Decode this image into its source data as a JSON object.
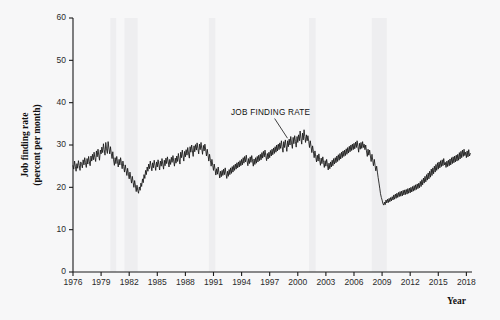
{
  "figure": {
    "background_color": "#f7f7f8",
    "ink_color": "#141414",
    "band_color": "#e9e9ec"
  },
  "chart_data": {
    "type": "line",
    "title": "",
    "xlabel": "Year",
    "ylabel_line1": "Job finding rate",
    "ylabel_line2": "(percent per month)",
    "xlim": [
      1976,
      2018.6
    ],
    "ylim": [
      0,
      60
    ],
    "grid": false,
    "legend": "none",
    "xticks": [
      1976,
      1979,
      1982,
      1985,
      1988,
      1991,
      1994,
      1997,
      2000,
      2003,
      2006,
      2009,
      2012,
      2015,
      2018
    ],
    "xtick_labels": [
      "1976",
      "1979",
      "1982",
      "1985",
      "1988",
      "1991",
      "1994",
      "1997",
      "2000",
      "2003",
      "2006",
      "2009",
      "2012",
      "2015",
      "2018"
    ],
    "yticks": [
      0,
      10,
      20,
      30,
      40,
      50,
      60
    ],
    "ytick_labels": [
      "0",
      "10",
      "20",
      "30",
      "40",
      "50",
      "60"
    ],
    "annotations": [
      {
        "text": "JOB FINDING RATE",
        "x": 1997.1,
        "y": 37.2,
        "leader_to_x": 1998.9,
        "leader_to_y": 31.6
      }
    ],
    "shaded_bands": [
      {
        "name": "recession-1980",
        "x0": 1980.0,
        "x1": 1980.6
      },
      {
        "name": "recession-1981-82",
        "x0": 1981.5,
        "x1": 1982.9
      },
      {
        "name": "recession-1990-91",
        "x0": 1990.5,
        "x1": 1991.2
      },
      {
        "name": "recession-2001",
        "x0": 2001.2,
        "x1": 2001.9
      },
      {
        "name": "recession-2007-09",
        "x0": 2007.9,
        "x1": 2009.5
      }
    ],
    "series": [
      {
        "name": "Job finding rate",
        "units": "percent per month",
        "frequency": "monthly",
        "x": [
          1976.0,
          1976.08,
          1976.17,
          1976.25,
          1976.33,
          1976.42,
          1976.5,
          1976.58,
          1976.67,
          1976.75,
          1976.83,
          1976.92,
          1977.0,
          1977.08,
          1977.17,
          1977.25,
          1977.33,
          1977.42,
          1977.5,
          1977.58,
          1977.67,
          1977.75,
          1977.83,
          1977.92,
          1978.0,
          1978.08,
          1978.17,
          1978.25,
          1978.33,
          1978.42,
          1978.5,
          1978.58,
          1978.67,
          1978.75,
          1978.83,
          1978.92,
          1979.0,
          1979.08,
          1979.17,
          1979.25,
          1979.33,
          1979.42,
          1979.5,
          1979.58,
          1979.67,
          1979.75,
          1979.83,
          1979.92,
          1980.0,
          1980.08,
          1980.17,
          1980.25,
          1980.33,
          1980.42,
          1980.5,
          1980.58,
          1980.67,
          1980.75,
          1980.83,
          1980.92,
          1981.0,
          1981.08,
          1981.17,
          1981.25,
          1981.33,
          1981.42,
          1981.5,
          1981.58,
          1981.67,
          1981.75,
          1981.83,
          1981.92,
          1982.0,
          1982.08,
          1982.17,
          1982.25,
          1982.33,
          1982.42,
          1982.5,
          1982.58,
          1982.67,
          1982.75,
          1982.83,
          1982.92,
          1983.0,
          1983.08,
          1983.17,
          1983.25,
          1983.33,
          1983.42,
          1983.5,
          1983.58,
          1983.67,
          1983.75,
          1983.83,
          1983.92,
          1984.0,
          1984.08,
          1984.17,
          1984.25,
          1984.33,
          1984.42,
          1984.5,
          1984.58,
          1984.67,
          1984.75,
          1984.83,
          1984.92,
          1985.0,
          1985.08,
          1985.17,
          1985.25,
          1985.33,
          1985.42,
          1985.5,
          1985.58,
          1985.67,
          1985.75,
          1985.83,
          1985.92,
          1986.0,
          1986.08,
          1986.17,
          1986.25,
          1986.33,
          1986.42,
          1986.5,
          1986.58,
          1986.67,
          1986.75,
          1986.83,
          1986.92,
          1987.0,
          1987.08,
          1987.17,
          1987.25,
          1987.33,
          1987.42,
          1987.5,
          1987.58,
          1987.67,
          1987.75,
          1987.83,
          1987.92,
          1988.0,
          1988.08,
          1988.17,
          1988.25,
          1988.33,
          1988.42,
          1988.5,
          1988.58,
          1988.67,
          1988.75,
          1988.83,
          1988.92,
          1989.0,
          1989.08,
          1989.17,
          1989.25,
          1989.33,
          1989.42,
          1989.5,
          1989.58,
          1989.67,
          1989.75,
          1989.83,
          1989.92,
          1990.0,
          1990.08,
          1990.17,
          1990.25,
          1990.33,
          1990.42,
          1990.5,
          1990.58,
          1990.67,
          1990.75,
          1990.83,
          1990.92,
          1991.0,
          1991.08,
          1991.17,
          1991.25,
          1991.33,
          1991.42,
          1991.5,
          1991.58,
          1991.67,
          1991.75,
          1991.83,
          1991.92,
          1992.0,
          1992.08,
          1992.17,
          1992.25,
          1992.33,
          1992.42,
          1992.5,
          1992.58,
          1992.67,
          1992.75,
          1992.83,
          1992.92,
          1993.0,
          1993.08,
          1993.17,
          1993.25,
          1993.33,
          1993.42,
          1993.5,
          1993.58,
          1993.67,
          1993.75,
          1993.83,
          1993.92,
          1994.0,
          1994.08,
          1994.17,
          1994.25,
          1994.33,
          1994.42,
          1994.5,
          1994.58,
          1994.67,
          1994.75,
          1994.83,
          1994.92,
          1995.0,
          1995.08,
          1995.17,
          1995.25,
          1995.33,
          1995.42,
          1995.5,
          1995.58,
          1995.67,
          1995.75,
          1995.83,
          1995.92,
          1996.0,
          1996.08,
          1996.17,
          1996.25,
          1996.33,
          1996.42,
          1996.5,
          1996.58,
          1996.67,
          1996.75,
          1996.83,
          1996.92,
          1997.0,
          1997.08,
          1997.17,
          1997.25,
          1997.33,
          1997.42,
          1997.5,
          1997.58,
          1997.67,
          1997.75,
          1997.83,
          1997.92,
          1998.0,
          1998.08,
          1998.17,
          1998.25,
          1998.33,
          1998.42,
          1998.5,
          1998.58,
          1998.67,
          1998.75,
          1998.83,
          1998.92,
          1999.0,
          1999.08,
          1999.17,
          1999.25,
          1999.33,
          1999.42,
          1999.5,
          1999.58,
          1999.67,
          1999.75,
          1999.83,
          1999.92,
          2000.0,
          2000.08,
          2000.17,
          2000.25,
          2000.33,
          2000.42,
          2000.5,
          2000.58,
          2000.67,
          2000.75,
          2000.83,
          2000.92,
          2001.0,
          2001.08,
          2001.17,
          2001.25,
          2001.33,
          2001.42,
          2001.5,
          2001.58,
          2001.67,
          2001.75,
          2001.83,
          2001.92,
          2002.0,
          2002.08,
          2002.17,
          2002.25,
          2002.33,
          2002.42,
          2002.5,
          2002.58,
          2002.67,
          2002.75,
          2002.83,
          2002.92,
          2003.0,
          2003.08,
          2003.17,
          2003.25,
          2003.33,
          2003.42,
          2003.5,
          2003.58,
          2003.67,
          2003.75,
          2003.83,
          2003.92,
          2004.0,
          2004.08,
          2004.17,
          2004.25,
          2004.33,
          2004.42,
          2004.5,
          2004.58,
          2004.67,
          2004.75,
          2004.83,
          2004.92,
          2005.0,
          2005.08,
          2005.17,
          2005.25,
          2005.33,
          2005.42,
          2005.5,
          2005.58,
          2005.67,
          2005.75,
          2005.83,
          2005.92,
          2006.0,
          2006.08,
          2006.17,
          2006.25,
          2006.33,
          2006.42,
          2006.5,
          2006.58,
          2006.67,
          2006.75,
          2006.83,
          2006.92,
          2007.0,
          2007.08,
          2007.17,
          2007.25,
          2007.33,
          2007.42,
          2007.5,
          2007.58,
          2007.67,
          2007.75,
          2007.83,
          2007.92,
          2008.0,
          2008.08,
          2008.17,
          2008.25,
          2008.33,
          2008.42,
          2008.5,
          2008.58,
          2008.67,
          2008.75,
          2008.83,
          2008.92,
          2009.0,
          2009.08,
          2009.17,
          2009.25,
          2009.33,
          2009.42,
          2009.5,
          2009.58,
          2009.67,
          2009.75,
          2009.83,
          2009.92,
          2010.0,
          2010.08,
          2010.17,
          2010.25,
          2010.33,
          2010.42,
          2010.5,
          2010.58,
          2010.67,
          2010.75,
          2010.83,
          2010.92,
          2011.0,
          2011.08,
          2011.17,
          2011.25,
          2011.33,
          2011.42,
          2011.5,
          2011.58,
          2011.67,
          2011.75,
          2011.83,
          2011.92,
          2012.0,
          2012.08,
          2012.17,
          2012.25,
          2012.33,
          2012.42,
          2012.5,
          2012.58,
          2012.67,
          2012.75,
          2012.83,
          2012.92,
          2013.0,
          2013.08,
          2013.17,
          2013.25,
          2013.33,
          2013.42,
          2013.5,
          2013.58,
          2013.67,
          2013.75,
          2013.83,
          2013.92,
          2014.0,
          2014.08,
          2014.17,
          2014.25,
          2014.33,
          2014.42,
          2014.5,
          2014.58,
          2014.67,
          2014.75,
          2014.83,
          2014.92,
          2015.0,
          2015.08,
          2015.17,
          2015.25,
          2015.33,
          2015.42,
          2015.5,
          2015.58,
          2015.67,
          2015.75,
          2015.83,
          2015.92,
          2016.0,
          2016.08,
          2016.17,
          2016.25,
          2016.33,
          2016.42,
          2016.5,
          2016.58,
          2016.67,
          2016.75,
          2016.83,
          2016.92,
          2017.0,
          2017.08,
          2017.17,
          2017.25,
          2017.33,
          2017.42,
          2017.5,
          2017.58,
          2017.67,
          2017.75,
          2017.83,
          2017.92,
          2018.0,
          2018.08,
          2018.17,
          2018.25,
          2018.33,
          2018.42
        ],
        "y": [
          25.1,
          24.3,
          26.2,
          25.0,
          23.8,
          25.6,
          24.5,
          26.3,
          25.2,
          24.0,
          26.0,
          25.4,
          24.6,
          26.5,
          25.3,
          27.0,
          25.8,
          24.7,
          26.8,
          25.5,
          27.3,
          26.0,
          25.1,
          27.4,
          26.2,
          27.8,
          26.5,
          28.3,
          27.0,
          26.1,
          28.6,
          27.2,
          29.0,
          27.6,
          26.4,
          28.8,
          27.9,
          29.5,
          28.2,
          30.3,
          28.9,
          27.6,
          30.6,
          29.1,
          28.0,
          30.8,
          29.3,
          27.9,
          29.6,
          28.1,
          26.8,
          28.4,
          26.5,
          25.2,
          27.0,
          25.6,
          27.3,
          26.0,
          24.8,
          26.6,
          25.3,
          27.0,
          25.7,
          24.4,
          26.2,
          24.9,
          23.6,
          25.3,
          24.0,
          22.8,
          24.5,
          23.1,
          22.0,
          23.6,
          22.2,
          21.0,
          22.6,
          21.2,
          20.0,
          21.6,
          20.3,
          19.0,
          20.5,
          19.2,
          18.6,
          20.1,
          19.3,
          21.0,
          20.2,
          22.0,
          21.1,
          23.0,
          22.1,
          24.0,
          23.0,
          24.8,
          23.8,
          25.5,
          24.4,
          26.2,
          25.1,
          23.9,
          25.8,
          24.6,
          26.4,
          25.2,
          24.0,
          26.0,
          24.8,
          26.5,
          25.3,
          24.1,
          26.2,
          25.0,
          26.8,
          25.5,
          24.3,
          26.4,
          25.1,
          26.9,
          25.6,
          27.2,
          26.0,
          24.8,
          26.6,
          25.4,
          27.1,
          25.9,
          27.5,
          26.2,
          25.0,
          26.9,
          25.7,
          27.4,
          26.1,
          28.0,
          26.7,
          25.5,
          28.3,
          27.0,
          28.8,
          27.4,
          26.2,
          28.5,
          27.2,
          28.9,
          27.6,
          29.4,
          28.1,
          26.9,
          29.6,
          28.3,
          30.0,
          28.6,
          27.3,
          29.8,
          28.4,
          30.1,
          28.8,
          30.5,
          29.2,
          27.9,
          30.2,
          28.9,
          30.6,
          29.1,
          27.8,
          29.9,
          28.6,
          30.2,
          28.8,
          27.4,
          29.0,
          27.6,
          26.2,
          27.8,
          26.4,
          25.0,
          26.6,
          25.2,
          24.0,
          25.5,
          24.2,
          22.9,
          24.4,
          23.1,
          24.8,
          23.5,
          22.2,
          23.8,
          22.5,
          24.0,
          22.8,
          24.3,
          23.0,
          24.6,
          23.3,
          22.1,
          23.8,
          22.6,
          24.2,
          23.0,
          24.6,
          23.3,
          24.9,
          23.6,
          25.2,
          24.0,
          25.5,
          24.3,
          25.8,
          24.6,
          26.0,
          24.8,
          26.3,
          25.1,
          26.6,
          25.3,
          27.0,
          25.7,
          27.3,
          26.0,
          27.6,
          26.3,
          25.1,
          26.8,
          25.6,
          27.2,
          25.9,
          27.5,
          26.2,
          25.0,
          26.7,
          25.4,
          27.0,
          25.7,
          27.3,
          26.0,
          27.6,
          26.3,
          27.8,
          26.5,
          28.2,
          26.9,
          28.5,
          27.2,
          28.8,
          27.5,
          26.3,
          28.0,
          26.7,
          28.3,
          27.0,
          28.7,
          27.4,
          29.0,
          27.7,
          29.3,
          28.0,
          29.6,
          28.3,
          30.0,
          28.6,
          30.2,
          28.9,
          30.5,
          29.2,
          31.0,
          29.6,
          28.3,
          30.8,
          29.4,
          31.2,
          29.8,
          28.5,
          31.0,
          29.6,
          31.4,
          30.0,
          32.0,
          30.5,
          29.2,
          31.8,
          30.3,
          32.2,
          30.8,
          29.5,
          32.0,
          30.6,
          32.4,
          31.0,
          33.3,
          31.6,
          30.2,
          32.8,
          31.2,
          33.6,
          32.0,
          30.6,
          32.4,
          31.0,
          32.2,
          30.8,
          29.4,
          31.0,
          29.6,
          28.2,
          29.8,
          28.4,
          27.0,
          28.6,
          27.2,
          26.0,
          27.6,
          26.2,
          27.9,
          26.5,
          25.2,
          26.9,
          25.6,
          27.2,
          25.9,
          24.7,
          26.3,
          25.0,
          26.6,
          25.3,
          24.1,
          25.7,
          24.4,
          26.0,
          24.8,
          26.4,
          25.1,
          26.8,
          25.5,
          27.0,
          25.8,
          27.4,
          26.1,
          27.7,
          26.4,
          28.0,
          26.7,
          28.3,
          27.0,
          28.6,
          27.3,
          28.8,
          27.5,
          29.1,
          27.8,
          29.4,
          28.1,
          29.7,
          28.4,
          30.0,
          28.7,
          30.2,
          28.9,
          30.4,
          29.1,
          30.7,
          29.4,
          31.0,
          29.6,
          28.3,
          30.4,
          29.0,
          30.6,
          29.2,
          30.8,
          29.4,
          30.2,
          28.9,
          30.0,
          28.6,
          27.3,
          29.0,
          27.6,
          28.8,
          27.4,
          26.1,
          27.8,
          26.4,
          25.1,
          26.6,
          25.2,
          23.9,
          25.0,
          23.6,
          22.3,
          21.0,
          19.8,
          18.5,
          17.6,
          17.0,
          16.2,
          15.8,
          16.5,
          15.9,
          17.0,
          16.3,
          17.2,
          16.4,
          17.4,
          16.6,
          17.6,
          16.8,
          17.8,
          17.0,
          18.2,
          17.2,
          18.4,
          17.4,
          18.6,
          17.6,
          18.8,
          17.8,
          19.0,
          17.9,
          19.1,
          18.0,
          19.3,
          18.2,
          19.4,
          18.3,
          19.5,
          18.4,
          19.7,
          18.6,
          19.8,
          18.7,
          20.0,
          18.9,
          20.2,
          19.1,
          20.4,
          19.3,
          20.6,
          19.5,
          20.8,
          19.7,
          21.0,
          19.9,
          21.4,
          20.2,
          21.8,
          20.6,
          22.2,
          21.0,
          22.6,
          21.3,
          23.0,
          21.7,
          23.4,
          22.0,
          23.8,
          22.4,
          24.3,
          22.8,
          24.6,
          23.2,
          25.0,
          23.6,
          25.4,
          24.0,
          25.8,
          24.3,
          26.0,
          24.6,
          26.3,
          24.9,
          26.5,
          25.1,
          26.8,
          25.3,
          25.9,
          24.7,
          26.2,
          24.9,
          26.4,
          25.1,
          26.7,
          25.3,
          27.0,
          25.6,
          27.2,
          25.8,
          27.4,
          26.0,
          27.6,
          26.2,
          27.8,
          26.4,
          28.2,
          26.7,
          28.5,
          27.0,
          28.8,
          27.3,
          29.0,
          27.5,
          28.3,
          27.0,
          28.6,
          27.2,
          28.9,
          27.4,
          28.0
        ]
      }
    ]
  }
}
